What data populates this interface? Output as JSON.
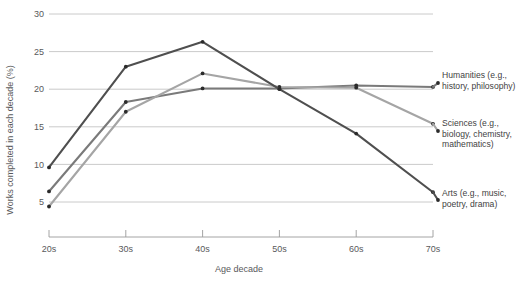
{
  "chart_data": {
    "type": "line",
    "title": "",
    "xlabel": "Age decade",
    "ylabel": "Works completed in each decade (%)",
    "categories": [
      "20s",
      "30s",
      "40s",
      "50s",
      "60s",
      "70s"
    ],
    "yticks": [
      5,
      10,
      15,
      20,
      25,
      30
    ],
    "ylim": [
      0,
      30
    ],
    "grid": true,
    "legend_position": "right-inline-labels",
    "series": [
      {
        "name": "Humanities (e.g., history, philosophy)",
        "label_line1": "Humanities (e.g.,",
        "label_line2": "history, philosophy)",
        "color": "#7a7a7a",
        "values": [
          6.4,
          18.3,
          20.1,
          20.1,
          20.5,
          20.3
        ]
      },
      {
        "name": "Sciences (e.g., biology, chemistry, mathematics)",
        "label_line1": "Sciences (e.g.,",
        "label_line2": "biology, chemistry,",
        "label_line3": "mathematics)",
        "color": "#a5a5a5",
        "values": [
          4.4,
          17.0,
          22.1,
          20.3,
          20.2,
          15.4
        ]
      },
      {
        "name": "Arts (e.g., music, poetry, drama)",
        "label_line1": "Arts (e.g., music,",
        "label_line2": "poetry, drama)",
        "color": "#4f4f4f",
        "values": [
          9.6,
          23.0,
          26.3,
          20.0,
          14.1,
          6.3
        ]
      }
    ]
  },
  "axis": {
    "y_title": "Works completed in each decade (%)",
    "x_title": "Age decade",
    "y_tick_labels": [
      "30",
      "25",
      "20",
      "15",
      "10",
      "5"
    ],
    "x_tick_labels": [
      "20s",
      "30s",
      "40s",
      "50s",
      "60s",
      "70s"
    ]
  }
}
